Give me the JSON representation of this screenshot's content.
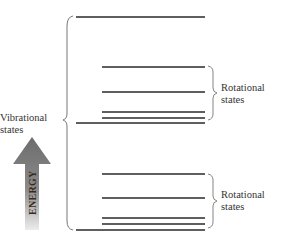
{
  "diagram": {
    "vibrational_label_line1": "Vibrational",
    "vibrational_label_line2": "states",
    "rotational_upper_line1": "Rotational",
    "rotational_upper_line2": "states",
    "rotational_lower_line1": "Rotational",
    "rotational_lower_line2": "states",
    "energy_label": "ENERGY",
    "vibrational_levels_y": [
      17,
      123,
      230
    ],
    "rotational_upper_levels_y": [
      67,
      92,
      112,
      117
    ],
    "rotational_lower_levels_y": [
      174,
      198,
      217,
      222
    ],
    "colors": {
      "line": "#2a2a2a",
      "brace": "#666666",
      "arrow_top": "#6f6f6f",
      "arrow_bottom": "#e2e2e2"
    }
  }
}
